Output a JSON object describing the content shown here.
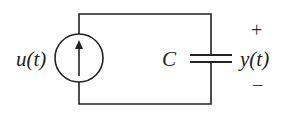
{
  "diagram": {
    "type": "circuit",
    "source": {
      "kind": "current-source",
      "label": "u(t)",
      "arrow_direction": "up"
    },
    "capacitor": {
      "label": "C"
    },
    "output": {
      "label": "y(t)",
      "plus": "+",
      "minus": "−"
    },
    "colors": {
      "wire": "#222222",
      "background": "#ffffff"
    }
  }
}
